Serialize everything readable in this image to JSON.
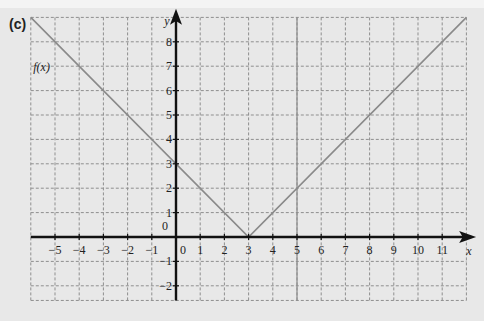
{
  "part_label": "(c)",
  "chart_data": {
    "type": "line",
    "title": "",
    "function_label": "f(x)",
    "xlabel": "x",
    "ylabel": "y",
    "xlim": [
      -6,
      12
    ],
    "ylim": [
      -2.6,
      9
    ],
    "grid": true,
    "grid_style": "dashed",
    "x_ticks": [
      -5,
      -4,
      -3,
      -2,
      -1,
      0,
      1,
      2,
      3,
      4,
      5,
      6,
      7,
      8,
      9,
      10,
      11
    ],
    "y_ticks": [
      -2,
      -1,
      0,
      1,
      2,
      3,
      4,
      5,
      6,
      7,
      8
    ],
    "series": [
      {
        "name": "f(x)",
        "expression": "|x - 3|",
        "x": [
          -6,
          3,
          12
        ],
        "y": [
          9,
          0,
          9
        ],
        "color": "#8a8a8a"
      }
    ],
    "vertical_lines": [
      {
        "x": 5,
        "color": "#8a8a8a"
      }
    ]
  },
  "colors": {
    "background": "#e8e8e8",
    "axis": "#111111",
    "grid": "#8f8f8f",
    "curve": "#8a8a8a"
  }
}
